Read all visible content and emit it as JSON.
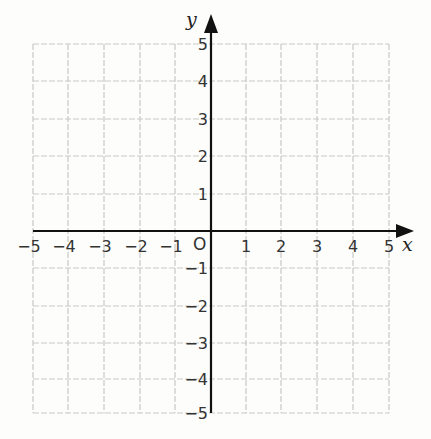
{
  "chart_data": {
    "type": "coordinate-plane",
    "title": "",
    "xlabel": "x",
    "ylabel": "y",
    "xlim": [
      -5,
      5
    ],
    "ylim": [
      -5,
      5
    ],
    "grid": true,
    "grid_style": "dashed",
    "x_ticks": [
      -5,
      -4,
      -3,
      -2,
      -1,
      1,
      2,
      3,
      4,
      5
    ],
    "y_ticks": [
      5,
      4,
      3,
      2,
      1,
      -1,
      -2,
      -3,
      -4,
      -5
    ],
    "origin_label": "O",
    "points": [],
    "series": []
  },
  "labels": {
    "x_axis": "x",
    "y_axis": "y",
    "origin": "O",
    "x_ticks": [
      "−5",
      "−4",
      "−3",
      "−2",
      "−1",
      "1",
      "2",
      "3",
      "4",
      "5"
    ],
    "y_ticks": [
      "5",
      "4",
      "3",
      "2",
      "1",
      "−1",
      "−2",
      "−3",
      "−4",
      "−5"
    ]
  },
  "colors": {
    "axis": "#111111",
    "grid": "#c9c9c6",
    "background": "#fdfdfb",
    "text": "#333333"
  }
}
